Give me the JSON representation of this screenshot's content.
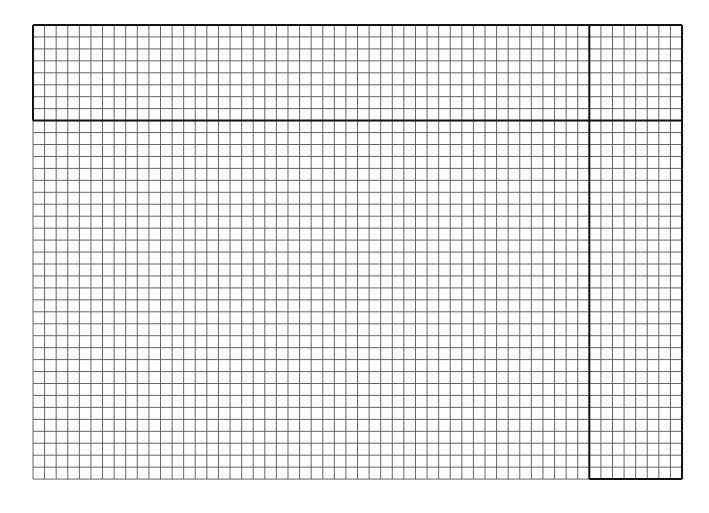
{
  "sheet": {
    "left": 33,
    "top": 25,
    "columns": 56,
    "rows": 38,
    "cell_width": 11.59,
    "cell_height": 11.95,
    "header_rows": 8,
    "side_columns": 8,
    "colors": {
      "background": "#ffffff",
      "thin_line": "#555555",
      "thick_line": "#111111"
    }
  }
}
